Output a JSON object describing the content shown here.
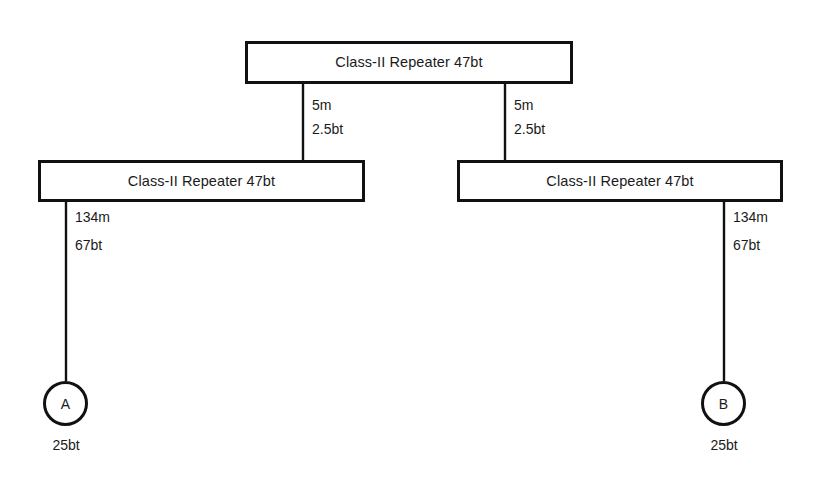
{
  "diagram": {
    "type": "network-topology-tree",
    "background_color": "#ffffff",
    "line_color": "#111111",
    "text_color": "#1a1a1a",
    "nodes": {
      "root_repeater": {
        "label": "Class-II Repeater 47bt",
        "x": 245,
        "y": 41,
        "width": 328,
        "height": 43
      },
      "left_repeater": {
        "label": "Class-II Repeater 47bt",
        "x": 38,
        "y": 160,
        "width": 327,
        "height": 42
      },
      "right_repeater": {
        "label": "Class-II Repeater 47bt",
        "x": 457,
        "y": 160,
        "width": 326,
        "height": 42
      },
      "station_a": {
        "letter": "A",
        "below_label": "25bt",
        "cx": 66,
        "cy": 403
      },
      "station_b": {
        "letter": "B",
        "below_label": "25bt",
        "cx": 724,
        "cy": 403
      }
    },
    "links": [
      {
        "id": "root-to-left",
        "length": "5m",
        "budget": "2.5bt",
        "x": 303,
        "y1": 84,
        "y2": 160
      },
      {
        "id": "root-to-right",
        "length": "5m",
        "budget": "2.5bt",
        "x": 505,
        "y1": 84,
        "y2": 160
      },
      {
        "id": "left-to-a",
        "length": "134m",
        "budget": "67bt",
        "x": 66,
        "y1": 202,
        "y2": 381
      },
      {
        "id": "right-to-b",
        "length": "134m",
        "budget": "67bt",
        "x": 724,
        "y1": 202,
        "y2": 381
      }
    ]
  }
}
